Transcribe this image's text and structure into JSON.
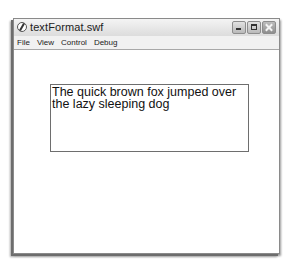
{
  "window": {
    "title": "textFormat.swf",
    "app_icon": "flash-player-icon",
    "controls": {
      "minimize": "minimize-icon",
      "maximize": "maximize-icon",
      "close": "close-icon"
    }
  },
  "menubar": {
    "items": [
      {
        "label": "File"
      },
      {
        "label": "View"
      },
      {
        "label": "Control"
      },
      {
        "label": "Debug"
      }
    ]
  },
  "stage": {
    "textfield": {
      "text": "The quick brown fox jumped over the lazy sleeping dog"
    }
  }
}
